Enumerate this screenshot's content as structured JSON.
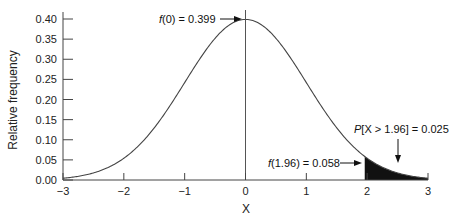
{
  "chart_data": {
    "type": "area",
    "title": "",
    "xlabel": "X",
    "ylabel": "Relative frequency",
    "xlim": [
      -3,
      3
    ],
    "ylim": [
      0,
      0.4
    ],
    "grid": false,
    "legend": null,
    "x_ticks": [
      "−3",
      "−2",
      "−1",
      "0",
      "1",
      "2",
      "3"
    ],
    "y_ticks": [
      "0.00",
      "0.05",
      "0.10",
      "0.15",
      "0.20",
      "0.25",
      "0.30",
      "0.35",
      "0.40"
    ],
    "series": [
      {
        "name": "Standard normal density",
        "x": [
          -3,
          -2.5,
          -2,
          -1.5,
          -1,
          -0.5,
          0,
          0.5,
          1,
          1.5,
          1.96,
          2,
          2.5,
          3
        ],
        "values": [
          0.004,
          0.018,
          0.054,
          0.13,
          0.242,
          0.352,
          0.399,
          0.352,
          0.242,
          0.13,
          0.058,
          0.054,
          0.018,
          0.004
        ]
      }
    ],
    "shaded_region": {
      "from": 1.96,
      "to": 3,
      "label": "P[X > 1.96] = 0.025"
    },
    "vertical_line": {
      "x": 0
    },
    "annotations": [
      {
        "text_prefix": "f",
        "text_rest": "(0) = 0.399",
        "x": 0,
        "y": 0.399
      },
      {
        "text_prefix": "f",
        "text_rest": "(1.96) = 0.058",
        "x": 1.96,
        "y": 0.058
      },
      {
        "text_prefix": "P",
        "text_rest": "[X > 1.96] = 0.025",
        "x": 2.5,
        "y": 0.02
      }
    ]
  }
}
